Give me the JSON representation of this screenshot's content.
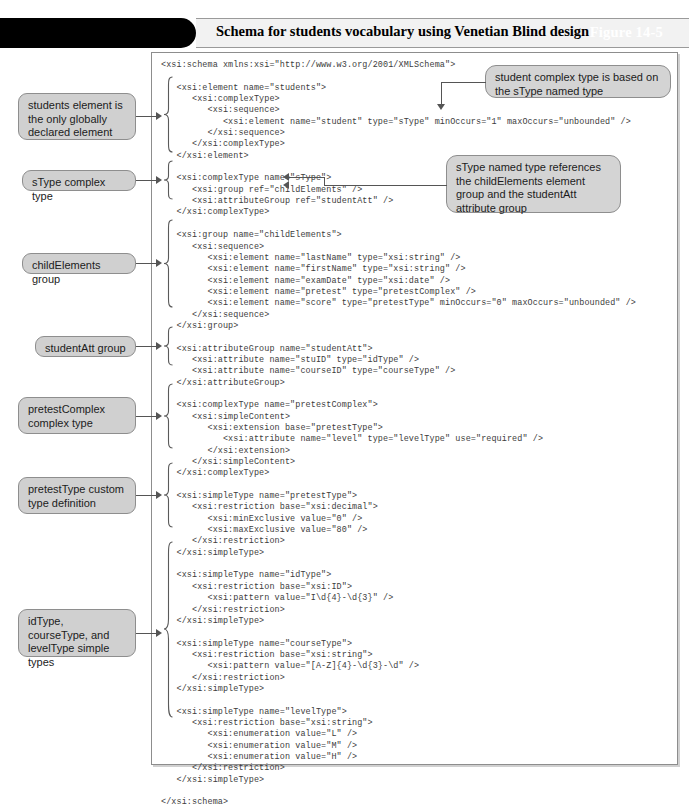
{
  "figure": {
    "tab_label": "Figure 14-5",
    "title": "Schema for students vocabulary using Venetian Blind design"
  },
  "code": {
    "language": "xml",
    "text": "<xsi:schema xmlns:xsi=\"http://www.w3.org/2001/XMLSchema\">\n\n   <xsi:element name=\"students\">\n      <xsi:complexType>\n         <xsi:sequence>\n            <xsi:element name=\"student\" type=\"sType\" minOccurs=\"1\" maxOccurs=\"unbounded\" />\n         </xsi:sequence>\n      </xsi:complexType>\n   </xsi:element>\n\n   <xsi:complexType name=\"sType\">\n      <xsi:group ref=\"childElements\" />\n      <xsi:attributeGroup ref=\"studentAtt\" />\n   </xsi:complexType>\n\n   <xsi:group name=\"childElements\">\n      <xsi:sequence>\n         <xsi:element name=\"lastName\" type=\"xsi:string\" />\n         <xsi:element name=\"firstName\" type=\"xsi:string\" />\n         <xsi:element name=\"examDate\" type=\"xsi:date\" />\n         <xsi:element name=\"pretest\" type=\"pretestComplex\" />\n         <xsi:element name=\"score\" type=\"pretestType\" minOccurs=\"0\" maxOccurs=\"unbounded\" />\n      </xsi:sequence>\n   </xsi:group>\n\n   <xsi:attributeGroup name=\"studentAtt\">\n      <xsi:attribute name=\"stuID\" type=\"idType\" />\n      <xsi:attribute name=\"courseID\" type=\"courseType\" />\n   </xsi:attributeGroup>\n\n   <xsi:complexType name=\"pretestComplex\">\n      <xsi:simpleContent>\n         <xsi:extension base=\"pretestType\">\n            <xsi:attribute name=\"level\" type=\"levelType\" use=\"required\" />\n         </xsi:extension>\n      </xsi:simpleContent>\n   </xsi:complexType>\n\n   <xsi:simpleType name=\"pretestType\">\n      <xsi:restriction base=\"xsi:decimal\">\n         <xsi:minExclusive value=\"0\" />\n         <xsi:maxExclusive value=\"80\" />\n      </xsi:restriction>\n   </xsi:simpleType>\n\n   <xsi:simpleType name=\"idType\">\n      <xsi:restriction base=\"xsi:ID\">\n         <xsi:pattern value=\"I\\d{4}-\\d{3}\" />\n      </xsi:restriction>\n   </xsi:simpleType>\n\n   <xsi:simpleType name=\"courseType\">\n      <xsi:restriction base=\"xsi:string\">\n         <xsi:pattern value=\"[A-Z]{4}-\\d{3}-\\d\" />\n      </xsi:restriction>\n   </xsi:simpleType>\n\n   <xsi:simpleType name=\"levelType\">\n      <xsi:restriction base=\"xsi:string\">\n         <xsi:enumeration value=\"L\" />\n         <xsi:enumeration value=\"M\" />\n         <xsi:enumeration value=\"H\" />\n      </xsi:restriction>\n   </xsi:simpleType>\n\n</xsi:schema>"
  },
  "callouts": {
    "left": [
      {
        "id": "students-element",
        "text": "students element is the only globally declared element"
      },
      {
        "id": "stype-complex-type",
        "text": "sType complex type"
      },
      {
        "id": "childelements-group",
        "text": "childElements group"
      },
      {
        "id": "studentatt-group",
        "text": "studentAtt group"
      },
      {
        "id": "pretestcomplex-complex-type",
        "text": "pretestComplex complex type"
      },
      {
        "id": "pretesttype-custom-type",
        "text": "pretestType custom type definition"
      },
      {
        "id": "simple-types",
        "text": "idType, courseType, and levelType simple types"
      }
    ],
    "right": [
      {
        "id": "student-complex-type-note",
        "text": "student complex type is based on the sType named type"
      },
      {
        "id": "stype-references-note",
        "text": "sType named type references the childElements element group and the studentAtt attribute group"
      }
    ]
  },
  "colors": {
    "tab_background": "#000000",
    "tab_text": "#ffffff",
    "title_bar_background": "#f2f2f2",
    "callout_background": "#d0d0d0",
    "callout_border": "#8e8e8e",
    "code_text": "#3c3c3c",
    "leader_line": "#555555",
    "panel_border": "#8d8d8d"
  }
}
